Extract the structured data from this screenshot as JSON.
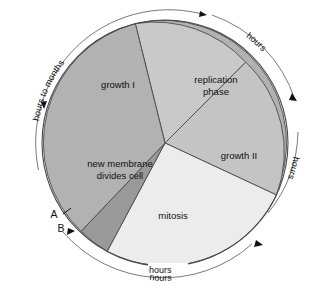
{
  "diagram": {
    "type": "pie-cycle-diagram",
    "center": {
      "x": 165,
      "y": 143
    },
    "inner_radius": 123,
    "outer_radius": 134
  },
  "sectors": [
    {
      "id": "growth-1",
      "label": "growth I",
      "color": "#b2b2b2",
      "start_angle": -104,
      "end_angle": 28,
      "label_x": 118,
      "label_y": 88
    },
    {
      "id": "replication-phase",
      "label_line1": "replication",
      "label_line2": "phase",
      "color": "#c9c9c9",
      "start_angle": -104,
      "end_angle": -49,
      "label_x": 216,
      "label_y": 86
    },
    {
      "id": "growth-2",
      "label": "growth II",
      "color": "#c4c4c4",
      "start_angle": -49,
      "end_angle": 25,
      "label_x": 239,
      "label_y": 156
    },
    {
      "id": "mitosis",
      "label": "mitosis",
      "color": "#ececec",
      "start_angle": 25,
      "end_angle": 118,
      "label_x": 173,
      "label_y": 216
    },
    {
      "id": "new-membrane",
      "label_line1": "new membrane",
      "label_line2": "divides cell",
      "color": "#9a9a9a",
      "start_angle": 118,
      "end_angle": 133,
      "label_x": 120,
      "label_y": 169
    }
  ],
  "ring_labels": [
    {
      "id": "hours-to-months",
      "text": "hours to months"
    },
    {
      "id": "hours-top-right",
      "text": "hours"
    },
    {
      "id": "hours-right",
      "text": "hours"
    },
    {
      "id": "hours-bottom",
      "text": "hours"
    }
  ],
  "markers": [
    {
      "id": "marker-a",
      "label": "A",
      "x": 54,
      "y": 215
    },
    {
      "id": "marker-b",
      "label": "B",
      "x": 61,
      "y": 229
    }
  ],
  "colors": {
    "background": "#ffffff",
    "outline": "#4a4a4a",
    "ring_stroke": "#6a6a6a",
    "text": "#111111"
  }
}
